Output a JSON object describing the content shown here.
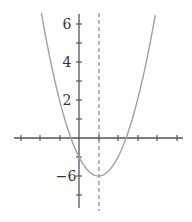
{
  "chart_data": {
    "type": "line",
    "title": "",
    "xlabel": "",
    "ylabel": "",
    "function": "y = (x - 1)^2 - 2",
    "vertex": [
      1,
      -2
    ],
    "axis_of_symmetry": {
      "x": 1,
      "style": "dashed"
    },
    "xlim": [
      -3,
      5.5
    ],
    "ylim": [
      -3.6,
      6.3
    ],
    "grid": false,
    "x_ticks": [
      -3,
      -2,
      -1,
      0,
      1,
      2,
      3,
      4,
      5
    ],
    "y_ticks": [
      -3,
      -2,
      -1,
      1,
      2,
      3,
      4,
      5,
      6
    ],
    "y_tick_labels": [
      {
        "value": 6,
        "text": "6"
      },
      {
        "value": 4,
        "text": "4"
      },
      {
        "value": 2,
        "text": "2"
      },
      {
        "value": -2,
        "text": "−6"
      }
    ],
    "series": [
      {
        "name": "parabola",
        "color": "#999999",
        "x": [
          -1.92,
          -1,
          -0.41,
          0,
          1,
          2,
          2.41,
          3,
          3.92
        ],
        "y": [
          6.5,
          2,
          0,
          -1,
          -2,
          -1,
          0,
          2,
          6.5
        ]
      }
    ],
    "colors": {
      "axis": "#555555",
      "curve": "#a0a0a0",
      "dashed": "#888888",
      "label": "#333333"
    }
  }
}
